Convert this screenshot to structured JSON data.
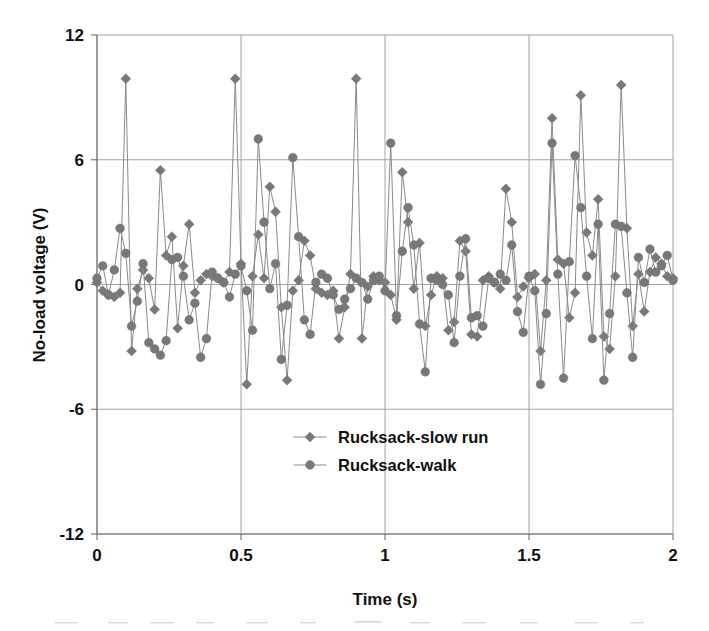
{
  "chart_data": {
    "type": "line",
    "title": "",
    "subtitle": "",
    "xlabel": "Time (s)",
    "ylabel": "No-load voltage (V)",
    "xlim": [
      0,
      2
    ],
    "ylim": [
      -12,
      12
    ],
    "xticks": [
      "0",
      "0.5",
      "1",
      "1.5",
      "2"
    ],
    "xtick_values": [
      0,
      0.5,
      1,
      1.5,
      2
    ],
    "yticks": [
      "12",
      "6",
      "0",
      "-6",
      "-12"
    ],
    "ytick_values": [
      12,
      6,
      0,
      -6,
      -12
    ],
    "grid": true,
    "legend_position": "center",
    "marker_color": "#787878",
    "line_color": "#8a8a8a",
    "series": [
      {
        "name": "Rucksack-slow run",
        "marker": "diamond",
        "color": "#787878",
        "x": [
          0.0,
          0.02,
          0.04,
          0.06,
          0.08,
          0.1,
          0.12,
          0.14,
          0.16,
          0.18,
          0.2,
          0.22,
          0.24,
          0.26,
          0.28,
          0.3,
          0.32,
          0.34,
          0.36,
          0.38,
          0.4,
          0.42,
          0.44,
          0.46,
          0.48,
          0.5,
          0.52,
          0.54,
          0.56,
          0.58,
          0.6,
          0.62,
          0.64,
          0.66,
          0.68,
          0.7,
          0.72,
          0.74,
          0.76,
          0.78,
          0.8,
          0.82,
          0.84,
          0.86,
          0.88,
          0.9,
          0.92,
          0.94,
          0.96,
          0.98,
          1.0,
          1.02,
          1.04,
          1.06,
          1.08,
          1.1,
          1.12,
          1.14,
          1.16,
          1.18,
          1.2,
          1.22,
          1.24,
          1.26,
          1.28,
          1.3,
          1.32,
          1.34,
          1.36,
          1.38,
          1.4,
          1.42,
          1.44,
          1.46,
          1.48,
          1.5,
          1.52,
          1.54,
          1.56,
          1.58,
          1.6,
          1.62,
          1.64,
          1.66,
          1.68,
          1.7,
          1.72,
          1.74,
          1.76,
          1.78,
          1.8,
          1.82,
          1.84,
          1.86,
          1.88,
          1.9,
          1.92,
          1.94,
          1.96,
          1.98,
          2.0
        ],
        "y": [
          0.1,
          -0.3,
          -0.5,
          -0.6,
          -0.4,
          9.9,
          -3.2,
          -0.2,
          0.7,
          0.3,
          -1.2,
          5.5,
          1.4,
          2.3,
          -2.1,
          0.9,
          2.9,
          -0.4,
          0.2,
          0.5,
          0.4,
          0.3,
          0.1,
          0.6,
          9.9,
          1.0,
          -4.8,
          0.4,
          2.4,
          0.3,
          4.7,
          3.5,
          -1.1,
          -4.6,
          -0.3,
          0.2,
          2.1,
          1.4,
          -0.2,
          -0.4,
          -0.5,
          -0.3,
          -2.6,
          -1.1,
          0.5,
          9.9,
          -2.6,
          -0.1,
          0.4,
          0.2,
          0.1,
          -0.5,
          -1.7,
          5.4,
          3.0,
          -0.2,
          2.0,
          -2.0,
          -0.5,
          0.4,
          0.3,
          -2.2,
          -1.8,
          2.1,
          1.6,
          -2.4,
          -2.5,
          0.2,
          0.4,
          0.1,
          -0.2,
          4.6,
          3.0,
          -0.6,
          -0.1,
          0.3,
          0.5,
          -3.2,
          0.2,
          8.0,
          1.2,
          1.0,
          -1.6,
          -0.4,
          9.1,
          2.5,
          1.4,
          4.1,
          -2.5,
          -3.1,
          0.4,
          9.6,
          2.7,
          -2.0,
          0.5,
          -1.3,
          0.6,
          1.3,
          1.0,
          0.4,
          0.3
        ]
      },
      {
        "name": "Rucksack-walk",
        "marker": "circle",
        "color": "#787878",
        "x": [
          0.0,
          0.02,
          0.04,
          0.06,
          0.08,
          0.1,
          0.12,
          0.14,
          0.16,
          0.18,
          0.2,
          0.22,
          0.24,
          0.26,
          0.28,
          0.3,
          0.32,
          0.34,
          0.36,
          0.38,
          0.4,
          0.42,
          0.44,
          0.46,
          0.48,
          0.5,
          0.52,
          0.54,
          0.56,
          0.58,
          0.6,
          0.62,
          0.64,
          0.66,
          0.68,
          0.7,
          0.72,
          0.74,
          0.76,
          0.78,
          0.8,
          0.82,
          0.84,
          0.86,
          0.88,
          0.9,
          0.92,
          0.94,
          0.96,
          0.98,
          1.0,
          1.02,
          1.04,
          1.06,
          1.08,
          1.1,
          1.12,
          1.14,
          1.16,
          1.18,
          1.2,
          1.22,
          1.24,
          1.26,
          1.28,
          1.3,
          1.32,
          1.34,
          1.36,
          1.38,
          1.4,
          1.42,
          1.44,
          1.46,
          1.48,
          1.5,
          1.52,
          1.54,
          1.56,
          1.58,
          1.6,
          1.62,
          1.64,
          1.66,
          1.68,
          1.7,
          1.72,
          1.74,
          1.76,
          1.78,
          1.8,
          1.82,
          1.84,
          1.86,
          1.88,
          1.9,
          1.92,
          1.94,
          1.96,
          1.98,
          2.0
        ],
        "y": [
          0.3,
          0.9,
          -0.5,
          0.7,
          2.7,
          1.5,
          -2.0,
          -0.8,
          1.0,
          -2.8,
          -3.1,
          -3.4,
          -2.7,
          1.2,
          1.3,
          0.4,
          -1.7,
          -0.9,
          -3.5,
          -2.6,
          0.6,
          0.3,
          0.1,
          -0.6,
          0.5,
          0.9,
          -0.3,
          -2.2,
          7.0,
          3.0,
          -0.2,
          1.0,
          -3.6,
          -1.0,
          6.1,
          2.3,
          -1.7,
          -2.4,
          0.1,
          0.5,
          0.3,
          -0.5,
          -1.2,
          -0.7,
          -0.2,
          0.3,
          0.1,
          -0.7,
          0.2,
          0.4,
          -0.3,
          6.8,
          -1.5,
          1.6,
          3.7,
          1.9,
          -1.9,
          -4.2,
          0.3,
          0.2,
          0.0,
          -0.5,
          -2.8,
          0.4,
          2.2,
          -1.6,
          -1.5,
          -2.0,
          0.3,
          0.1,
          0.5,
          0.2,
          1.9,
          -1.3,
          -2.3,
          0.4,
          -0.3,
          -4.8,
          -1.4,
          6.8,
          0.5,
          -4.5,
          1.1,
          6.2,
          3.7,
          0.4,
          -2.6,
          2.9,
          -4.6,
          -1.4,
          2.9,
          2.8,
          -0.4,
          -3.5,
          1.3,
          0.1,
          1.7,
          0.6,
          0.9,
          1.4,
          0.2
        ]
      }
    ]
  },
  "axes": {
    "y_title": "No-load voltage (V)",
    "x_title": "Time (s)"
  },
  "legend": {
    "items": [
      {
        "label": "Rucksack-slow run",
        "marker": "diamond"
      },
      {
        "label": "Rucksack-walk",
        "marker": "circle"
      }
    ]
  },
  "colors": {
    "marker": "#787878",
    "line": "#8a8a8a",
    "grid": "#9a9a9a",
    "axis": "#6e6e6e",
    "text": "#111111",
    "background": "#ffffff"
  }
}
